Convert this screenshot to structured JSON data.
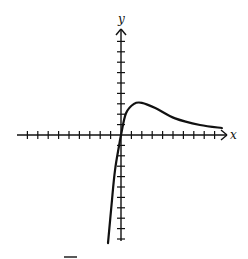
{
  "chart_data": {
    "type": "line",
    "title": "",
    "xlabel": "x",
    "ylabel": "y",
    "grid": false,
    "legend": null,
    "xlim": [
      -10,
      10
    ],
    "ylim": [
      -10,
      10
    ],
    "tick_spacing": 1,
    "tick_labels": false,
    "series": [
      {
        "name": "f(x)",
        "x": [
          -1.25,
          -0.87,
          -0.58,
          -0.19,
          0,
          0.48,
          1.25,
          2.0,
          3.3,
          5.2,
          7.6,
          9.7
        ],
        "y": [
          -10.4,
          -6.25,
          -3.4,
          -1.06,
          0,
          2.1,
          3.0,
          3.1,
          2.6,
          1.6,
          0.96,
          0.67
        ]
      }
    ],
    "annotations": [
      "curve passes through origin",
      "local maximum near (2, 3)",
      "approaches x-axis as x increases"
    ]
  },
  "colors": {
    "ink": "#111111",
    "background": "#ffffff"
  }
}
